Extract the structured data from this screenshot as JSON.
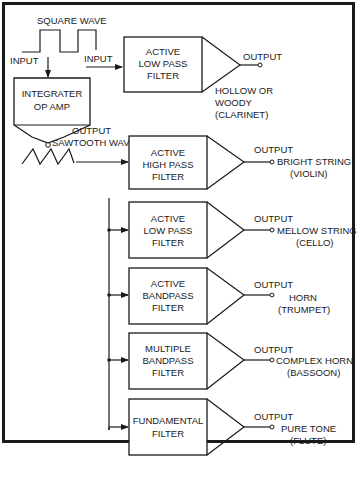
{
  "diagram": {
    "source": {
      "square_wave_label": "SQUARE WAVE",
      "input_label_left": "INPUT",
      "input_label_right": "INPUT",
      "integrator": {
        "line1": "INTEGRATER",
        "line2": "OP AMP"
      },
      "output_label": "OUTPUT",
      "sawtooth_label": "SAWTOOTH WAVE"
    },
    "filters": [
      {
        "line1": "ACTIVE",
        "line2": "LOW PASS",
        "line3": "FILTER",
        "output": "OUTPUT",
        "voice1": "HOLLOW OR",
        "voice2": "WOODY",
        "voice3": "(CLARINET)",
        "input": "square"
      },
      {
        "line1": "ACTIVE",
        "line2": "HIGH PASS",
        "line3": "FILTER",
        "output": "OUTPUT",
        "voice1": "BRIGHT STRING",
        "voice2": "(VIOLIN)",
        "input": "sawtooth"
      },
      {
        "line1": "ACTIVE",
        "line2": "LOW PASS",
        "line3": "FILTER",
        "output": "OUTPUT",
        "voice1": "MELLOW STRING",
        "voice2": "(CELLO)",
        "input": "bus"
      },
      {
        "line1": "ACTIVE",
        "line2": "BANDPASS",
        "line3": "FILTER",
        "output": "OUTPUT",
        "voice1": "HORN",
        "voice2": "(TRUMPET)",
        "input": "bus"
      },
      {
        "line1": "MULTIPLE",
        "line2": "BANDPASS",
        "line3": "FILTER",
        "output": "OUTPUT",
        "voice1": "COMPLEX HORN",
        "voice2": "(BASSOON)",
        "input": "bus"
      },
      {
        "line1": "FUNDAMENTAL",
        "line2": "FILTER",
        "line3": "",
        "output": "OUTPUT",
        "voice1": "PURE TONE",
        "voice2": "(FLUTE)",
        "input": "bus"
      }
    ]
  }
}
